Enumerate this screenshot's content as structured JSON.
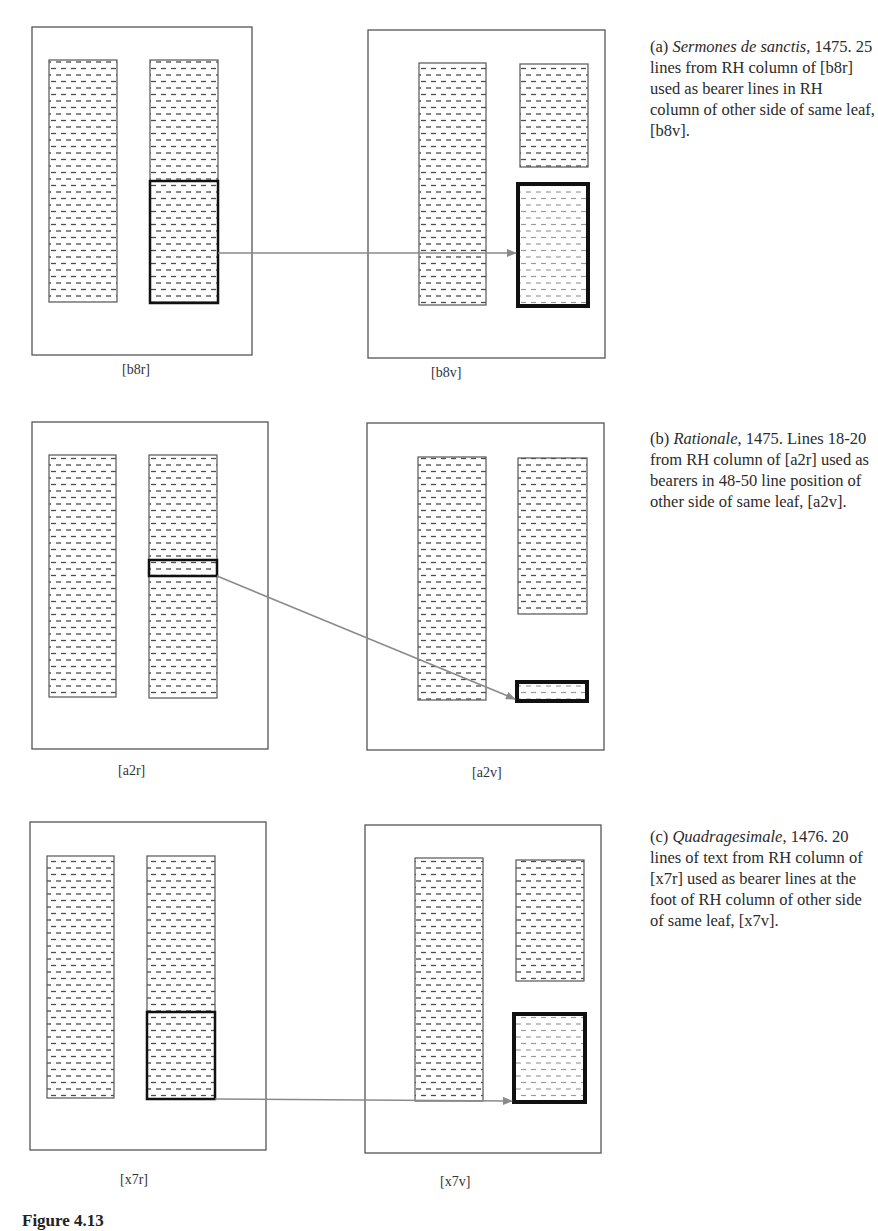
{
  "figure": {
    "caption_partial": "Figure 4.13",
    "colors": {
      "page_border": "#555555",
      "column_border": "#555555",
      "dash": "#555555",
      "highlight_border": "#111111",
      "arrow": "#8a8a8a"
    }
  },
  "panels": [
    {
      "id": "a",
      "caption": {
        "prefix": "(a) ",
        "title": "Sermones de sanctis,",
        "rest": " 1475. 25 lines from RH column of [b8r] used as bearer lines in RH column of other side of same leaf, [b8v].",
        "top": 36
      },
      "recto": {
        "label": "[b8r]",
        "label_x": 122,
        "label_y": 362,
        "page": [
          32,
          27,
          220,
          328
        ],
        "columns": [
          [
            49,
            60,
            68,
            242
          ],
          [
            150,
            60,
            68,
            242
          ]
        ],
        "highlight": [
          150,
          181,
          68,
          122
        ]
      },
      "verso": {
        "label": "[b8v]",
        "label_x": 431,
        "label_y": 365,
        "page": [
          368,
          30,
          237,
          328
        ],
        "columns": [
          [
            419,
            63,
            67,
            242
          ],
          [
            520,
            64,
            68,
            103
          ]
        ],
        "highlight": [
          518,
          184,
          70,
          122
        ]
      },
      "arrow": [
        218,
        253,
        516,
        253
      ]
    },
    {
      "id": "b",
      "caption": {
        "prefix": "(b) ",
        "title": "Rationale",
        "rest": ", 1475. Lines 18-20 from RH column of [a2r] used as bearers in 48-50 line position of other side of same leaf, [a2v].",
        "top": 428
      },
      "recto": {
        "label": "[a2r]",
        "label_x": 118,
        "label_y": 763,
        "page": [
          32,
          422,
          236,
          327
        ],
        "columns": [
          [
            49,
            455,
            67,
            242
          ],
          [
            149,
            455,
            68,
            243
          ]
        ],
        "highlight": [
          149,
          560,
          68,
          16
        ]
      },
      "verso": {
        "label": "[a2v]",
        "label_x": 472,
        "label_y": 765,
        "page": [
          367,
          423,
          237,
          327
        ],
        "columns": [
          [
            418,
            457,
            68,
            243
          ],
          [
            518,
            458,
            69,
            156
          ]
        ],
        "highlight": [
          517,
          682,
          70,
          19
        ]
      },
      "arrow": [
        217,
        576,
        515,
        699
      ]
    },
    {
      "id": "c",
      "caption": {
        "prefix": "(c) ",
        "title": "Quadragesimale",
        "rest": ", 1476. 20 lines of text from RH column of [x7r] used as bearer lines at the foot of RH column of other side of same leaf, [x7v].",
        "top": 826
      },
      "recto": {
        "label": "[x7r]",
        "label_x": 120,
        "label_y": 1172,
        "page": [
          30,
          822,
          236,
          328
        ],
        "columns": [
          [
            47,
            856,
            67,
            242
          ],
          [
            147,
            856,
            68,
            243
          ]
        ],
        "highlight": [
          147,
          1012,
          68,
          87
        ]
      },
      "verso": {
        "label": "[x7v]",
        "label_x": 440,
        "label_y": 1174,
        "page": [
          365,
          825,
          236,
          328
        ],
        "columns": [
          [
            415,
            858,
            68,
            243
          ],
          [
            516,
            860,
            68,
            121
          ]
        ],
        "highlight": [
          514,
          1014,
          71,
          88
        ]
      },
      "arrow": [
        215,
        1099,
        512,
        1101
      ]
    }
  ]
}
